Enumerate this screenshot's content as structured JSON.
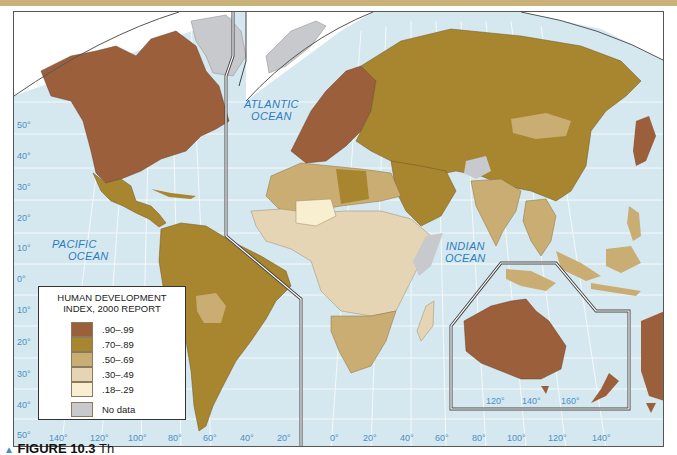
{
  "figure": {
    "caption_prefix": "▲",
    "caption_label": "FIGURE 10.3",
    "caption_text": "Th"
  },
  "colors": {
    "ocean": "#d6e8ef",
    "hdi_90_99": "#9c5f3c",
    "hdi_70_89": "#a8862f",
    "hdi_50_69": "#c9ad73",
    "hdi_30_49": "#e6d5b5",
    "hdi_18_29": "#f8efd0",
    "no_data": "#c8c9cc",
    "label_blue": "#2a7cc0"
  },
  "oceans": {
    "atlantic": [
      "ATLANTIC",
      "OCEAN"
    ],
    "pacific": [
      "PACIFIC",
      "OCEAN"
    ],
    "indian": [
      "INDIAN",
      "OCEAN"
    ]
  },
  "latitude_labels": [
    "50°",
    "40°",
    "30°",
    "20°",
    "10°",
    "0°",
    "10°",
    "20°",
    "30°",
    "40°",
    "50°"
  ],
  "longitude_labels_west": [
    "140°",
    "120°",
    "100°",
    "80°",
    "60°",
    "40°",
    "20°"
  ],
  "longitude_labels_east": [
    "0°",
    "20°",
    "40°",
    "60°",
    "80°",
    "100°",
    "120°",
    "140°"
  ],
  "inset_longitude_labels": [
    "120°",
    "140°",
    "160°"
  ],
  "legend": {
    "title_line1": "HUMAN DEVELOPMENT",
    "title_line2": "INDEX, 2000 REPORT",
    "items": [
      {
        "label": ".90–.99",
        "color": "#9c5f3c"
      },
      {
        "label": ".70–.89",
        "color": "#a8862f"
      },
      {
        "label": ".50–.69",
        "color": "#c9ad73"
      },
      {
        "label": ".30–.49",
        "color": "#e6d5b5"
      },
      {
        "label": ".18–.29",
        "color": "#f8efd0"
      },
      {
        "label": "No data",
        "color": "#c8c9cc"
      }
    ]
  }
}
